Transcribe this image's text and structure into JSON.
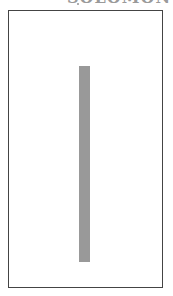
{
  "header": {
    "clipped_text": "SOLOMON"
  },
  "panel": {
    "bar_color": "#999999",
    "frame_color": "#444444"
  }
}
